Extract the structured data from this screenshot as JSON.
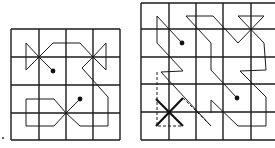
{
  "figure": {
    "left_grid": {
      "columns": 4,
      "rows": 4,
      "x_lines": [
        11,
        39,
        66,
        93,
        120
      ],
      "y_lines": [
        29,
        57,
        85,
        113,
        140
      ],
      "dots": [
        [
          53,
          71
        ],
        [
          80,
          99
        ]
      ]
    },
    "right_grid": {
      "columns": 5,
      "rows": 5,
      "x_lines": [
        141,
        169,
        196,
        223,
        251,
        278
      ],
      "y_lines": [
        3,
        29,
        57,
        84,
        112,
        140
      ],
      "dots": [
        [
          182,
          43
        ],
        [
          237,
          98
        ]
      ]
    },
    "corner_mark": "."
  }
}
